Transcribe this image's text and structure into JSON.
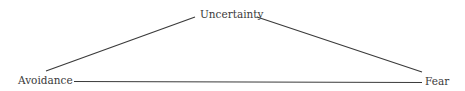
{
  "diagram": {
    "type": "triangle",
    "nodes": [
      {
        "id": "uncertainty",
        "label": "Uncertainty",
        "position": "top"
      },
      {
        "id": "avoidance",
        "label": "Avoidance",
        "position": "bottom-left"
      },
      {
        "id": "fear",
        "label": "Fear",
        "position": "bottom-right"
      }
    ],
    "edges": [
      {
        "from": "avoidance",
        "to": "uncertainty"
      },
      {
        "from": "uncertainty",
        "to": "fear"
      },
      {
        "from": "avoidance",
        "to": "fear"
      }
    ],
    "colors": {
      "line": "#3a3a3a",
      "text": "#3a3a3a",
      "background": "#ffffff"
    }
  }
}
